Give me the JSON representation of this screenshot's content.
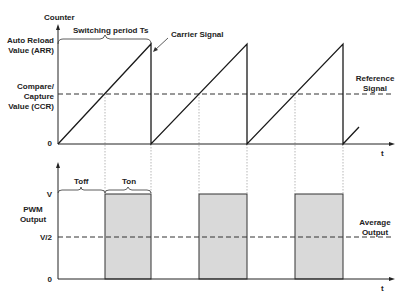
{
  "diagram": {
    "top_chart": {
      "y_axis_label": "Counter",
      "x_axis_label": "t",
      "y_levels": {
        "arr_line1": "Auto Reload",
        "arr_line2": "Value (ARR)",
        "ccr_line1": "Compare/",
        "ccr_line2": "Capture",
        "ccr_line3": "Value (CCR)",
        "zero": "0"
      },
      "period_label": "Switching period Ts",
      "carrier_label": "Carrier Signal",
      "reference_label_line1": "Reference",
      "reference_label_line2": "Signal"
    },
    "bottom_chart": {
      "y_axis_label_line1": "PWM",
      "y_axis_label_line2": "Output",
      "x_axis_label": "t",
      "y_levels": {
        "v": "V",
        "half_v": "V/2",
        "zero": "0"
      },
      "toff_label": "Toff",
      "ton_label": "Ton",
      "average_label_line1": "Average",
      "average_label_line2": "Output"
    },
    "colors": {
      "line": "#1a1a1a",
      "pulse_fill": "#d9d9d9",
      "guide": "#888888"
    }
  }
}
